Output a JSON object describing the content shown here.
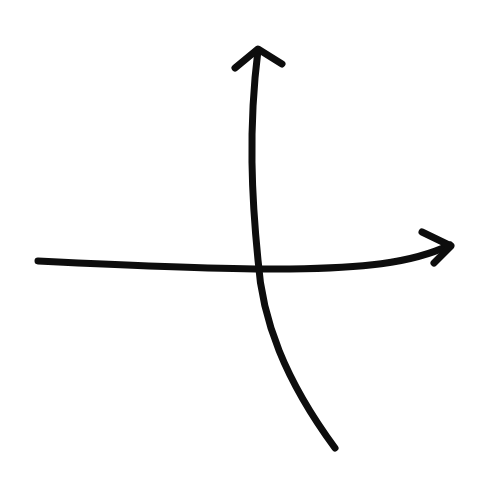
{
  "diagram": {
    "background": "#ffffff",
    "stroke_color": "#0d0d0d",
    "stroke_width": 7,
    "arrows": [
      {
        "name": "horizontal-axis-arrow",
        "direction": "right",
        "path": "M 38 261 C 140 266, 230 270, 290 269 C 360 268, 410 264, 450 245",
        "head": "M 422 232 L 451 246 L 434 263"
      },
      {
        "name": "vertical-axis-arrow",
        "direction": "up",
        "path": "M 335 448 C 285 380, 262 320, 258 260 C 252 200, 248 130, 258 50",
        "head": "M 235 68 L 258 49 L 282 64"
      }
    ]
  }
}
